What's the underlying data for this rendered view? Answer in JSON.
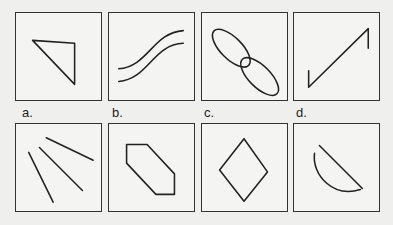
{
  "figure": {
    "top_row": [
      {
        "id": "top-1",
        "shape": "right-triangle"
      },
      {
        "id": "top-2",
        "shape": "two-parallel-s-curves"
      },
      {
        "id": "top-3",
        "shape": "two-connected-ellipses"
      },
      {
        "id": "top-4",
        "shape": "zigzag-line"
      }
    ],
    "labels": [
      "a.",
      "b.",
      "c.",
      "d."
    ],
    "bottom_row": [
      {
        "id": "a",
        "shape": "three-diverging-lines"
      },
      {
        "id": "b",
        "shape": "elongated-hexagon"
      },
      {
        "id": "c",
        "shape": "rhombus"
      },
      {
        "id": "d",
        "shape": "semicircle-segment"
      }
    ]
  }
}
